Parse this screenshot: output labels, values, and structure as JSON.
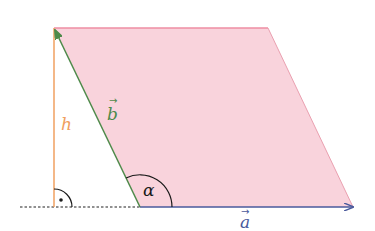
{
  "diagram": {
    "colors": {
      "fill": "#f9d3dc",
      "top_edge": "#ee8ea3",
      "right_edge": "#eaa0b0",
      "vector_a": "#4a5a9c",
      "vector_b": "#4e8a4a",
      "height": "#f0a060",
      "angle": "#1a1a1a",
      "baseline": "#222222"
    },
    "labels": {
      "height": "h",
      "vector_b": "b",
      "vector_a": "a",
      "angle": "α",
      "vector_arrow": "→"
    },
    "points": {
      "top_left": [
        54,
        28
      ],
      "top_right": [
        268,
        28
      ],
      "bottom_right": [
        353,
        207
      ],
      "bottom_left": [
        140,
        207
      ],
      "height_foot": [
        54,
        207
      ],
      "baseline_start": [
        20,
        207
      ]
    }
  }
}
